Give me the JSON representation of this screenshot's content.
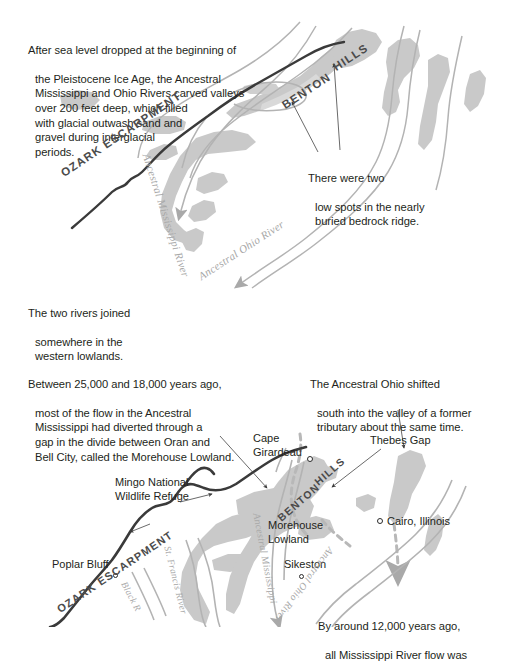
{
  "figure": {
    "type": "two-panel-geologic-map",
    "background_color": "#ffffff",
    "colors": {
      "text": "#231f20",
      "upland_gray": "#c9c9c9",
      "lowland_gray": "#d8d8d8",
      "river_gray": "#b3b3b3",
      "escarpment_dark": "#3a3a3a",
      "leader_line": "#444444"
    }
  },
  "panel_top": {
    "captions": [
      {
        "name": "caption-sea-level",
        "line1": "After sea level dropped at the beginning of",
        "rest": "the Pleistocene Ice Age, the Ancestral\nMississippi and Ohio Rivers carved valleys\nover 200 feet deep, which filled\nwith glacial outwash sand and\ngravel during interglacial\nperiods."
      },
      {
        "name": "caption-low-spots",
        "line1": "There were two",
        "rest": "low spots in the nearly\nburied bedrock ridge."
      },
      {
        "name": "caption-two-rivers",
        "line1": "The two rivers joined",
        "rest": "somewhere in the\nwestern lowlands."
      }
    ],
    "map_labels": {
      "escarpment": "OZARK ESCARPMENT",
      "hills_benton": "BENTON",
      "hills_hills": "HILLS",
      "river_mississippi": "Ancestral Mississippi River",
      "river_ohio": "Ancestral Ohio River"
    }
  },
  "panel_bottom": {
    "captions": [
      {
        "name": "caption-diverted-flow",
        "line1": "Between 25,000 and 18,000 years ago,",
        "rest": "most of the flow in the Ancestral\nMississippi had diverted through a\ngap in the divide between Oran and\nBell City, called the Morehouse Lowland."
      },
      {
        "name": "caption-ohio-shifted",
        "line1": "The Ancestral Ohio shifted",
        "rest": "south into the valley of a former\ntributary about the same time."
      },
      {
        "name": "caption-12000-years",
        "line1": "By around 12,000 years ago,",
        "rest": "all Mississippi River flow was"
      }
    ],
    "map_labels": {
      "escarpment": "OZARK ESCARPMENT",
      "hills_benton": "BENTON",
      "hills_hills": "HILLS",
      "river_mississippi": "Ancestral Mississippi",
      "river_ohio": "Ancestral Ohio River",
      "river_st_francis": "St. Francis River",
      "river_black": "Black R"
    },
    "places": [
      {
        "name": "place-cape-girardeau",
        "label": "Cape\nGirardeau",
        "has_dot": true
      },
      {
        "name": "place-thebes-gap",
        "label": "Thebes Gap",
        "has_dot": false
      },
      {
        "name": "place-cairo-illinois",
        "label": "Cairo, Illinois",
        "has_dot": true
      },
      {
        "name": "place-sikeston",
        "label": "Sikeston",
        "has_dot": true
      },
      {
        "name": "place-poplar-bluff",
        "label": "Poplar Bluff",
        "has_dot": true
      },
      {
        "name": "place-morehouse-lowland",
        "label": "Morehouse\nLowland",
        "has_dot": false
      },
      {
        "name": "place-mingo-refuge",
        "label": "Mingo National\nWildlife Refuge",
        "has_dot": false
      }
    ]
  }
}
